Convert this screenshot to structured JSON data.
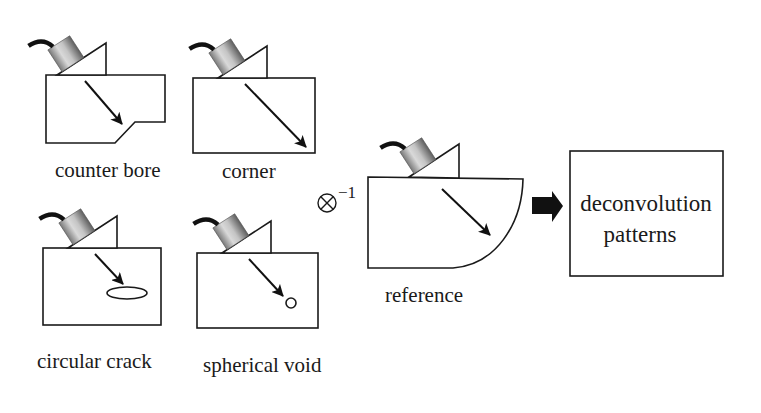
{
  "figure": {
    "panels": [
      {
        "id": "counter-bore",
        "label": "counter bore",
        "defect": "counter bore step"
      },
      {
        "id": "corner",
        "label": "corner",
        "defect": "corner reflector"
      },
      {
        "id": "circular-crack",
        "label": "circular crack",
        "defect": "elliptical crack"
      },
      {
        "id": "spherical-void",
        "label": "spherical void",
        "defect": "small circle void"
      }
    ],
    "operator": {
      "symbol": "⊗",
      "exponent": "−1",
      "meaning": "deconvolution"
    },
    "reference": {
      "label": "reference"
    },
    "output_box": {
      "line1": "deconvolution",
      "line2": "patterns"
    },
    "colors": {
      "stroke": "#1a1a1a",
      "transducer_light": "#d6d6d6",
      "transducer_dark": "#6e6e6e",
      "background": "#ffffff"
    }
  }
}
